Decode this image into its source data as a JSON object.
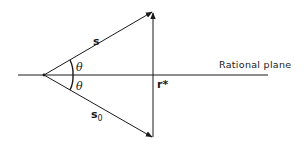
{
  "diagram": {
    "labels": {
      "vector_s": "s",
      "vector_s0_main": "s",
      "vector_s0_sub": "0",
      "angle_upper": "θ",
      "angle_lower": "θ",
      "point_r": "r*",
      "plane": "Rational plane"
    },
    "colors": {
      "line": "#1a1a1a",
      "background": "#ffffff"
    }
  }
}
